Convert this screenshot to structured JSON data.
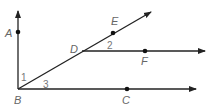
{
  "diagram": {
    "type": "geometry-rays",
    "points": [
      {
        "name": "A",
        "label": "A"
      },
      {
        "name": "B",
        "label": "B"
      },
      {
        "name": "C",
        "label": "C"
      },
      {
        "name": "D",
        "label": "D"
      },
      {
        "name": "E",
        "label": "E"
      },
      {
        "name": "F",
        "label": "F"
      }
    ],
    "angles": [
      {
        "label": "1"
      },
      {
        "label": "2"
      },
      {
        "label": "3"
      }
    ],
    "rays": [
      "BA",
      "BE",
      "BC",
      "DF"
    ],
    "line_color": "#222222",
    "label_color": "#666666"
  }
}
